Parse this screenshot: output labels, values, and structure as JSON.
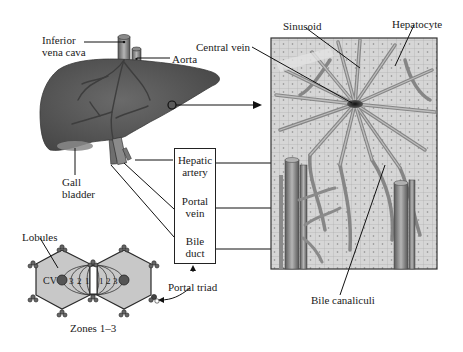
{
  "figure": {
    "colors": {
      "liver_fill": "#5e5e5e",
      "liver_shade": "#4a4a4a",
      "vessel": "#7a7a7a",
      "tissue_bg": "#cfcfcf",
      "cell_fill": "#d9d9d9",
      "sinusoid": "#8c8c8c",
      "lobule_fill": "#c8c8c8",
      "outline": "#222222",
      "background": "#ffffff"
    }
  },
  "liver": {
    "labels": {
      "ivc_line1": "Inferior",
      "ivc_line2": "vena cava",
      "aorta": "Aorta",
      "gall_line1": "Gall",
      "gall_line2": "bladder"
    }
  },
  "triad_box": {
    "items": [
      {
        "line1": "Hepatic",
        "line2": "artery"
      },
      {
        "line1": "Portal",
        "line2": "vein"
      },
      {
        "line1": "Bile",
        "line2": "duct"
      }
    ]
  },
  "micro": {
    "labels": {
      "central_vein": "Central vein",
      "sinusoid": "Sinusoid",
      "hepatocyte": "Hepatocyte",
      "bile_canaliculi": "Bile canaliculi"
    }
  },
  "lobules": {
    "labels": {
      "lobules": "Lobules",
      "cv": "CV",
      "portal_triad": "Portal triad",
      "zones": "Zones 1–3"
    },
    "zone_numbers_left": [
      "3",
      "2",
      "1"
    ],
    "zone_numbers_right": [
      "1",
      "2",
      "3"
    ]
  }
}
